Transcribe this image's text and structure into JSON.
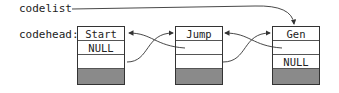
{
  "labels": {
    "codelist": "codelist",
    "codehead": "codehead:"
  },
  "nodes": [
    {
      "name": "Start",
      "cells": [
        "Start",
        "NULL",
        "",
        ""
      ]
    },
    {
      "name": "Jump",
      "cells": [
        "Jump",
        "",
        "",
        ""
      ]
    },
    {
      "name": "Gen",
      "cells": [
        "Gen",
        "",
        "NULL",
        ""
      ]
    }
  ],
  "colors": {
    "line": "#333333",
    "shaded_cell": "#8a8a8a"
  }
}
